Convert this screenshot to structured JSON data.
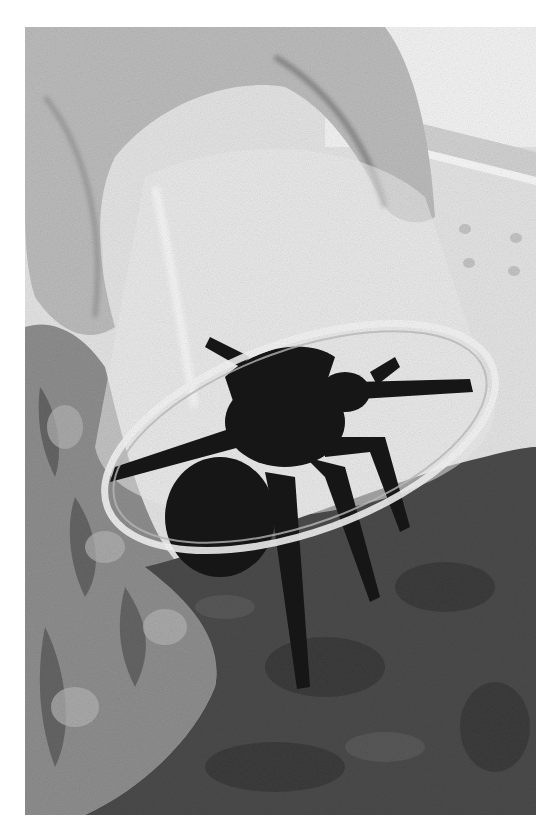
{
  "image": {
    "description": "Grayscale photograph of a dark hairy tarantula being covered by a clear plastic cup held by a hand, inside an enclosure with cork bark on the left and moss substrate below",
    "subjects": [
      "tarantula",
      "clear plastic cup",
      "hand",
      "cork bark",
      "moss substrate",
      "enclosure wall"
    ],
    "colors": {
      "background": "#ffffff",
      "wall": "#e6e6e6",
      "hand": "#bdbdbd",
      "cup_rim": "#f2f2f2",
      "spider": "#161616",
      "moss": "#4a4a4a",
      "bark": "#8e8e8e"
    }
  }
}
